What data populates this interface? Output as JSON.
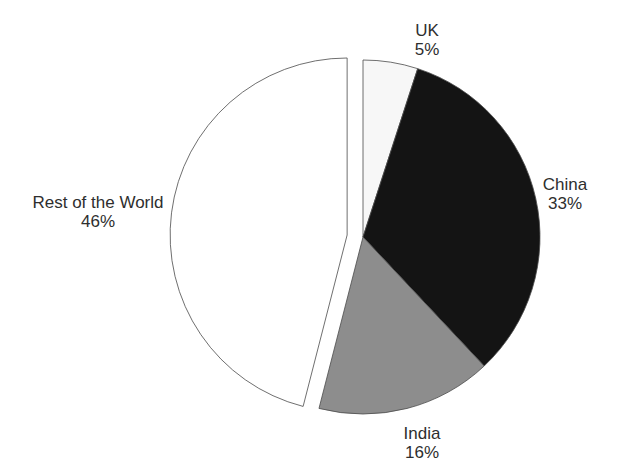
{
  "chart_data": {
    "type": "pie",
    "title": "",
    "direction": "clockwise",
    "start_angle_deg": 0,
    "legend": "none",
    "labels_position": "outside",
    "outline_color": "#4a4a4a",
    "background_color": "#ffffff",
    "text_color": "#2e2e2e",
    "slices": [
      {
        "label": "UK",
        "value": 5,
        "pct_label": "5%",
        "color": "#f7f7f7",
        "exploded": false
      },
      {
        "label": "China",
        "value": 33,
        "pct_label": "33%",
        "color": "#141414",
        "exploded": false
      },
      {
        "label": "India",
        "value": 16,
        "pct_label": "16%",
        "color": "#8d8d8d",
        "exploded": false
      },
      {
        "label": "Rest of the World",
        "value": 46,
        "pct_label": "46%",
        "color": "#ffffff",
        "exploded": true
      }
    ]
  }
}
